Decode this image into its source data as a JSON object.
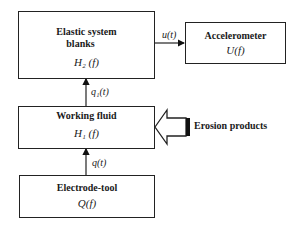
{
  "blocks": {
    "elastic": {
      "title_line1": "Elastic system",
      "title_line2": "blanks",
      "transfer": "H₂ (f)"
    },
    "accelerometer": {
      "title": "Accelerometer",
      "transfer": "U(f)"
    },
    "working_fluid": {
      "title": "Working fluid",
      "transfer": "H₁ (f)"
    },
    "electrode": {
      "title": "Electrode-tool",
      "transfer": "Q(f)"
    }
  },
  "signals": {
    "elastic_to_accelerometer": "u(t)",
    "fluid_to_elastic": "q₁(t)",
    "electrode_to_fluid": "q(t)"
  },
  "external_input": {
    "label": "Erosion products"
  }
}
